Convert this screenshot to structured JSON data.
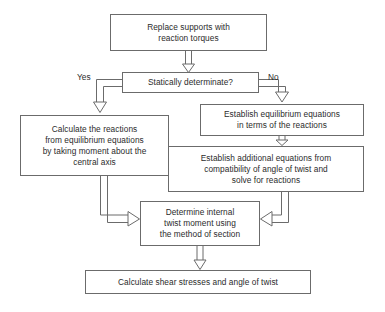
{
  "diagram": {
    "background_color": "#ffffff",
    "stroke_color": "#6b6b6b",
    "text_color": "#2b2b2b",
    "nodes": {
      "replace_supports": {
        "label": "Replace supports with\nreaction torques",
        "x": 110,
        "y": 14,
        "w": 157,
        "h": 37
      },
      "statically_determinate": {
        "label": "Statically determinate?",
        "x": 122,
        "y": 72,
        "w": 137,
        "h": 21
      },
      "calculate_reactions": {
        "label": "Calculate the reactions\nfrom equilibrium equations\nby taking moment about the\ncentral axis",
        "x": 20,
        "y": 115,
        "w": 149,
        "h": 61
      },
      "establish_equilibrium": {
        "label": "Establish equilibrium equations\nin terms of the reactions",
        "x": 200,
        "y": 104,
        "w": 164,
        "h": 32
      },
      "establish_additional": {
        "label": "Establish additional equations from\ncompatibility of angle of twist and\nsolve for reactions",
        "x": 168,
        "y": 146,
        "w": 196,
        "h": 46
      },
      "determine_internal": {
        "label": "Determine internal\ntwist moment using\nthe method of section",
        "x": 140,
        "y": 201,
        "w": 120,
        "h": 45
      },
      "calculate_shear": {
        "label": "Calculate shear stresses and angle of twist",
        "x": 85,
        "y": 270,
        "w": 226,
        "h": 24
      }
    },
    "edge_labels": {
      "yes": {
        "text": "Yes",
        "x": 77,
        "y": 72
      },
      "no": {
        "text": "No",
        "x": 268,
        "y": 72
      }
    },
    "connectors": [
      {
        "name": "replace-to-decision",
        "from": "replace_supports",
        "to": "statically_determinate",
        "style": "hollow-arrow-down"
      },
      {
        "name": "decision-yes-to-calculate",
        "from": "statically_determinate",
        "to": "calculate_reactions",
        "style": "hollow-arrow-elbow-left-down"
      },
      {
        "name": "decision-no-to-equilibrium",
        "from": "statically_determinate",
        "to": "establish_equilibrium",
        "style": "hollow-arrow-elbow-right-down"
      },
      {
        "name": "equilibrium-to-additional",
        "from": "establish_equilibrium",
        "to": "establish_additional",
        "style": "hollow-arrow-down"
      },
      {
        "name": "calculate-to-determine",
        "from": "calculate_reactions",
        "to": "determine_internal",
        "style": "hollow-arrow-elbow-down-right"
      },
      {
        "name": "additional-to-determine",
        "from": "establish_additional",
        "to": "determine_internal",
        "style": "hollow-arrow-elbow-down-left"
      },
      {
        "name": "determine-to-shear",
        "from": "determine_internal",
        "to": "calculate_shear",
        "style": "hollow-arrow-down"
      }
    ]
  }
}
